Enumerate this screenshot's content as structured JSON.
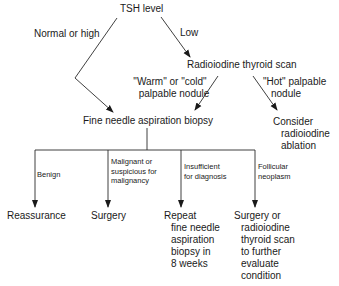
{
  "nodes": {
    "tsh": "TSH level",
    "scan": "Radioiodine thyroid scan",
    "fna": "Fine needle aspiration biopsy",
    "ablation": [
      "Consider",
      "radioiodine",
      "ablation"
    ],
    "reassurance": "Reassurance",
    "surgery": "Surgery",
    "repeat": [
      "Repeat",
      "fine needle",
      "aspiration",
      "biopsy in",
      "8 weeks"
    ],
    "surgery_or_scan": [
      "Surgery or",
      "radioiodine",
      "thyroid scan",
      "to further",
      "evaluate",
      "condition"
    ]
  },
  "edges": {
    "normal_high": "Normal or high",
    "low": "Low",
    "warm_cold": [
      "\"Warm\" or \"cold\"",
      "palpable nodule"
    ],
    "hot": [
      "\"Hot\" palpable",
      "nodule"
    ],
    "benign": "Benign",
    "malignant": [
      "Malignant or",
      "suspicious for",
      "malignancy"
    ],
    "insufficient": [
      "Insufficient",
      "for diagnosis"
    ],
    "follicular": [
      "Follicular",
      "neoplasm"
    ]
  },
  "colors": {
    "line": "#2a2a2a",
    "text": "#1a1a1a",
    "background": "#ffffff"
  }
}
